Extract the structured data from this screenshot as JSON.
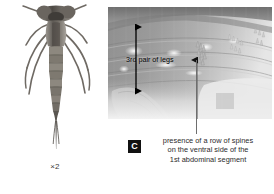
{
  "figure": {
    "specimen": {
      "name": "dragonfly-larva-dorsal-view",
      "scale_label": "×2"
    },
    "closeup": {
      "name": "ventral-abdomen-closeup-photograph",
      "measure_label": "3rd pair of legs",
      "measure_arrow": "double-headed-vertical-arrow",
      "pointer_arrow": "up-arrow-to-spines"
    },
    "caption": {
      "badge": "C",
      "line1": "presence of a row of spines",
      "line2": "on the ventral side of the",
      "line3": "1st abdominal segment"
    }
  },
  "colors": {
    "badge_background": "#111111",
    "badge_text": "#ffffff",
    "caption_text": "#2b2b2b",
    "annotation": "#000000",
    "leader_line": "#6e6e6e",
    "photo_base": "#9a9a9a",
    "page_background": "#ffffff"
  }
}
